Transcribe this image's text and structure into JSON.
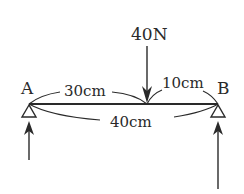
{
  "diagram": {
    "type": "simply-supported beam",
    "points": {
      "A": {
        "label": "A"
      },
      "B": {
        "label": "B"
      }
    },
    "load": {
      "label": "40N",
      "direction": "down"
    },
    "dimensions": {
      "left_segment": "30cm",
      "right_segment": "10cm",
      "total_length": "40cm"
    },
    "supports": {
      "A": {
        "type": "pin",
        "reaction_arrow": "up"
      },
      "B": {
        "type": "pin",
        "reaction_arrow": "up"
      }
    },
    "colors": {
      "stroke": "#2a2a2a",
      "background": "#ffffff"
    }
  }
}
